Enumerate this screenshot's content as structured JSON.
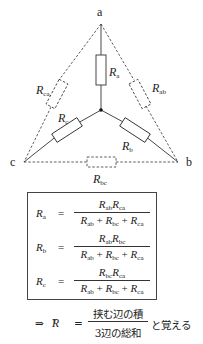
{
  "diagram": {
    "nodes": {
      "a": "a",
      "b": "b",
      "c": "c"
    },
    "y_resistors": {
      "a": {
        "symbol": "R",
        "sub": "a"
      },
      "b": {
        "symbol": "R",
        "sub": "b"
      },
      "c": {
        "symbol": "R",
        "sub": "c"
      }
    },
    "delta_resistors": {
      "ab": {
        "symbol": "R",
        "sub": "ab"
      },
      "bc": {
        "symbol": "R",
        "sub": "bc"
      },
      "ca": {
        "symbol": "R",
        "sub": "ca"
      }
    }
  },
  "formulas": [
    {
      "lhs": {
        "symbol": "R",
        "sub": "a"
      },
      "equals": "=",
      "num": [
        {
          "symbol": "R",
          "sub": "ab"
        },
        {
          "symbol": "R",
          "sub": "ca"
        }
      ],
      "den": [
        {
          "symbol": "R",
          "sub": "ab"
        },
        {
          "op": "+"
        },
        {
          "symbol": "R",
          "sub": "bc"
        },
        {
          "op": "+"
        },
        {
          "symbol": "R",
          "sub": "ca"
        }
      ]
    },
    {
      "lhs": {
        "symbol": "R",
        "sub": "b"
      },
      "equals": "=",
      "num": [
        {
          "symbol": "R",
          "sub": "ab"
        },
        {
          "symbol": "R",
          "sub": "bc"
        }
      ],
      "den": [
        {
          "symbol": "R",
          "sub": "ab"
        },
        {
          "op": "+"
        },
        {
          "symbol": "R",
          "sub": "bc"
        },
        {
          "op": "+"
        },
        {
          "symbol": "R",
          "sub": "ca"
        }
      ]
    },
    {
      "lhs": {
        "symbol": "R",
        "sub": "c"
      },
      "equals": "=",
      "num": [
        {
          "symbol": "R",
          "sub": "bc"
        },
        {
          "symbol": "R",
          "sub": "ca"
        }
      ],
      "den": [
        {
          "symbol": "R",
          "sub": "ab"
        },
        {
          "op": "+"
        },
        {
          "symbol": "R",
          "sub": "bc"
        },
        {
          "op": "+"
        },
        {
          "symbol": "R",
          "sub": "ca"
        }
      ]
    }
  ],
  "mnemonic": {
    "arrow": "⇒",
    "lhs": {
      "symbol": "R",
      "sub": "Y"
    },
    "equals": "=",
    "numerator": "挟む辺の積",
    "denominator": "3辺の総和",
    "suffix": "と覚える"
  }
}
